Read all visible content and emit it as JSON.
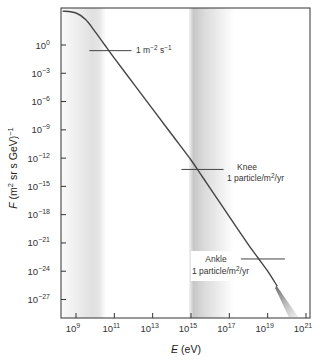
{
  "chart_data": {
    "type": "line",
    "title": "",
    "xlabel": "E (eV)",
    "xlabel_var": "E",
    "xlabel_unit": " (eV)",
    "ylabel": "F (m2 sr s GeV)-1",
    "ylabel_var": "F",
    "ylabel_unit_prefix": " (m",
    "ylabel_unit_sup1": "2",
    "ylabel_unit_mid": " sr s GeV)",
    "ylabel_unit_sup2": "−1",
    "xscale": "log",
    "yscale": "log",
    "xlim": [
      100000000.0,
      1e+21
    ],
    "ylim": [
      1e-29,
      10000.0
    ],
    "grid": false,
    "legend": null,
    "x_ticks": [
      {
        "base": "10",
        "exp": "9"
      },
      {
        "base": "10",
        "exp": "11"
      },
      {
        "base": "10",
        "exp": "13"
      },
      {
        "base": "10",
        "exp": "15"
      },
      {
        "base": "10",
        "exp": "17"
      },
      {
        "base": "10",
        "exp": "19"
      },
      {
        "base": "10",
        "exp": "21"
      }
    ],
    "y_ticks": [
      {
        "base": "10",
        "exp": "0"
      },
      {
        "base": "10",
        "exp": "−3"
      },
      {
        "base": "10",
        "exp": "−6"
      },
      {
        "base": "10",
        "exp": "−9"
      },
      {
        "base": "10",
        "exp": "−12"
      },
      {
        "base": "10",
        "exp": "−15"
      },
      {
        "base": "10",
        "exp": "−18"
      },
      {
        "base": "10",
        "exp": "−21"
      },
      {
        "base": "10",
        "exp": "−24"
      },
      {
        "base": "10",
        "exp": "−27"
      }
    ],
    "series": [
      {
        "name": "Cosmic ray flux",
        "x_log10": [
          8.3,
          9.0,
          9.5,
          10.0,
          10.5,
          11.0,
          12.0,
          13.0,
          14.0,
          15.0,
          15.5,
          16.0,
          17.0,
          18.0,
          18.5,
          19.0,
          19.5,
          20.0,
          20.5
        ],
        "y_log10": [
          3.6,
          3.4,
          2.7,
          1.4,
          0.0,
          -1.4,
          -4.1,
          -6.8,
          -9.5,
          -12.2,
          -13.7,
          -15.2,
          -18.2,
          -21.2,
          -22.6,
          -24.0,
          -25.6,
          -27.3,
          -29.0
        ]
      }
    ],
    "shaded_bands_log10E": [
      {
        "from": 8.3,
        "to": 10.3,
        "peak": 9.8,
        "intensity": 0.12
      },
      {
        "from": 14.9,
        "to": 16.9,
        "peak": 15.3,
        "intensity": 0.22
      }
    ],
    "annotations": [
      {
        "id": "one-per-m2-s",
        "text_parts": [
          "1 m",
          "−2",
          " s",
          "−1"
        ],
        "line_log10E": [
          9.7,
          11.9
        ],
        "y_log10": -0.6
      },
      {
        "id": "knee",
        "title": "Knee",
        "text": "1 particle/m",
        "sup": "2",
        "text_tail": "/yr",
        "line_log10E": [
          14.5,
          16.7
        ],
        "y_log10": -13.2
      },
      {
        "id": "ankle",
        "title": "Ankle",
        "text": "1 particle/m",
        "sup": "2",
        "text_tail": "/yr",
        "line_log10E": [
          17.6,
          19.9
        ],
        "y_log10": -22.7
      }
    ]
  }
}
